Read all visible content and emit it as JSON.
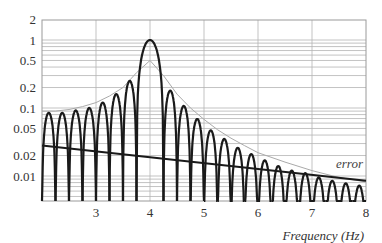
{
  "chart_data": {
    "type": "line",
    "title": "",
    "xlabel": "Frequency (Hz)",
    "ylabel": "",
    "xscale": "linear",
    "yscale": "log",
    "xlim": [
      2,
      8
    ],
    "ylim": [
      0.0046,
      2
    ],
    "grid": true,
    "legend": "none",
    "x_ticks": [
      3,
      4,
      5,
      6,
      7,
      8
    ],
    "x_tick_labels": [
      "3",
      "4",
      "5",
      "6",
      "7",
      "8"
    ],
    "y_ticks": [
      2,
      1,
      0.5,
      0.2,
      0.1,
      0.05,
      0.02,
      0.01
    ],
    "y_tick_labels": [
      "2",
      "1",
      "0.5",
      "0.2",
      "0.1",
      "0.05",
      "0.02",
      "0.01"
    ],
    "main_lobe_center": 4,
    "lobe_spacing_hz": 0.25,
    "series": [
      {
        "name": "spectrum",
        "style": "thick black arches (|sinc| lobes)",
        "color": "#1a1a1a",
        "lobe_centers": [
          2.125,
          2.375,
          2.625,
          2.875,
          3.125,
          3.375,
          3.625,
          4.0,
          4.375,
          4.625,
          4.875,
          5.125,
          5.375,
          5.625,
          5.875,
          6.125,
          6.375,
          6.625,
          6.875,
          7.125,
          7.375,
          7.625,
          7.875
        ],
        "lobe_peaks": [
          0.085,
          0.085,
          0.092,
          0.1,
          0.12,
          0.16,
          0.25,
          1.0,
          0.18,
          0.107,
          0.069,
          0.047,
          0.035,
          0.026,
          0.021,
          0.017,
          0.014,
          0.012,
          0.011,
          0.0095,
          0.0085,
          0.0078,
          0.0072
        ]
      },
      {
        "name": "envelope",
        "style": "thin gray smooth curve",
        "color": "#aaaaaa",
        "x": [
          2.0,
          2.25,
          2.5,
          2.75,
          3.0,
          3.25,
          3.5,
          3.75,
          4.0,
          4.25,
          4.5,
          4.75,
          5.0,
          5.25,
          5.5,
          5.75,
          6.0,
          6.5,
          7.0,
          7.5,
          8.0
        ],
        "values": [
          0.09,
          0.09,
          0.095,
          0.105,
          0.12,
          0.15,
          0.2,
          0.33,
          0.5,
          0.3,
          0.16,
          0.1,
          0.068,
          0.048,
          0.036,
          0.028,
          0.022,
          0.016,
          0.012,
          0.0095,
          0.0082
        ]
      },
      {
        "name": "error",
        "style": "thick black straight line",
        "color": "#1a1a1a",
        "x": [
          2,
          8
        ],
        "values": [
          0.028,
          0.0085
        ]
      }
    ],
    "annotations": [
      {
        "text": "error",
        "x": 7.55,
        "y": 0.014
      }
    ]
  },
  "labels": {
    "x_axis_title": "Frequency (Hz)",
    "error_label": "error"
  }
}
